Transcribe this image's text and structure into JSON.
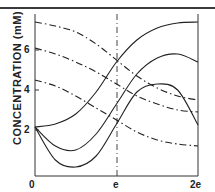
{
  "chart_data": {
    "type": "line",
    "title": "",
    "xlabel": "",
    "ylabel": "CONCENTRATION (mM)",
    "x_ticks": [
      "0",
      "e",
      "2e"
    ],
    "y_ticks": [
      "2",
      "4",
      "6"
    ],
    "xlim": [
      0,
      2
    ],
    "ylim": [
      -0.3,
      7.8
    ],
    "grid": false,
    "reference_lines": [
      {
        "type": "vertical",
        "x": 1,
        "style": "dashed",
        "label": "e"
      }
    ],
    "x": [
      0,
      0.25,
      0.5,
      0.75,
      1.0,
      1.25,
      1.5,
      1.75,
      2.0
    ],
    "series": [
      {
        "name": "dash-dot 1",
        "style": "dash-dot",
        "values": [
          7.4,
          7.2,
          6.9,
          6.3,
          5.5,
          4.7,
          4.1,
          3.7,
          3.5
        ]
      },
      {
        "name": "dash-dot 2",
        "style": "dash-dot",
        "values": [
          6.1,
          5.8,
          5.4,
          4.9,
          4.3,
          3.7,
          3.3,
          3.0,
          2.9
        ]
      },
      {
        "name": "dash-dot 3",
        "style": "dash-dot",
        "values": [
          4.5,
          4.2,
          3.7,
          3.1,
          2.5,
          1.9,
          1.5,
          1.3,
          1.2
        ]
      },
      {
        "name": "solid 1",
        "style": "solid",
        "values": [
          2.15,
          2.3,
          2.8,
          3.9,
          5.4,
          6.5,
          7.1,
          7.35,
          7.4
        ]
      },
      {
        "name": "solid 2",
        "style": "solid",
        "values": [
          2.15,
          1.2,
          1.0,
          1.8,
          3.3,
          4.8,
          5.6,
          5.8,
          5.4
        ]
      },
      {
        "name": "solid 3",
        "style": "solid",
        "values": [
          2.15,
          0.5,
          0.15,
          0.7,
          2.3,
          3.9,
          4.3,
          4.0,
          2.25
        ]
      }
    ]
  },
  "axis": {
    "ylabel": "CONCENTRATION (mM)",
    "x_ticks": [
      "0",
      "e",
      "2e"
    ],
    "y_ticks": [
      "2",
      "4",
      "6"
    ]
  }
}
